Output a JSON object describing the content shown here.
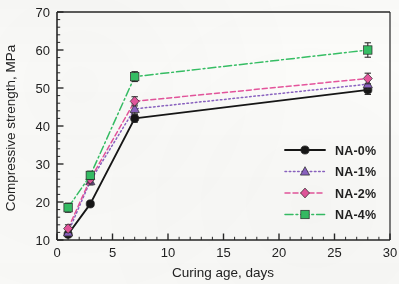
{
  "chart_data": {
    "type": "line",
    "title": "",
    "xlabel": "Curing age, days",
    "ylabel": "Compressive strength, MPa",
    "xlim": [
      0,
      30
    ],
    "ylim": [
      10,
      70
    ],
    "xticks": [
      0,
      5,
      10,
      15,
      20,
      25,
      30
    ],
    "xtick_labels": [
      "0",
      "5",
      "10",
      "15",
      "20",
      "25",
      "30"
    ],
    "yticks": [
      10,
      20,
      30,
      40,
      50,
      60,
      70
    ],
    "ytick_labels": [
      "10",
      "20",
      "30",
      "40",
      "50",
      "60",
      "70"
    ],
    "x_minor_step": 1,
    "y_minor_step": 2,
    "grid": false,
    "legend_position": "lower right",
    "x": [
      1,
      3,
      7,
      28
    ],
    "series": [
      {
        "name": "NA-0%",
        "color": "#1a1a1a",
        "linestyle": "solid",
        "marker": "circle",
        "values": [
          11.5,
          19.5,
          42.0,
          49.5
        ],
        "errors": [
          0.7,
          0.6,
          1.0,
          1.2
        ]
      },
      {
        "name": "NA-1%",
        "color": "#8c63c4",
        "linestyle": "dotted",
        "marker": "triangle",
        "values": [
          12.0,
          25.5,
          44.5,
          51.0
        ],
        "errors": [
          1.0,
          1.0,
          1.3,
          1.3
        ]
      },
      {
        "name": "NA-2%",
        "color": "#e8559e",
        "linestyle": "dashed",
        "marker": "diamond",
        "values": [
          13.0,
          26.0,
          46.5,
          52.5
        ],
        "errors": [
          1.0,
          1.0,
          1.2,
          1.4
        ]
      },
      {
        "name": "NA-4%",
        "color": "#34bf63",
        "linestyle": "dashdot",
        "marker": "square",
        "values": [
          18.5,
          27.0,
          53.0,
          60.0
        ],
        "errors": [
          1.2,
          1.1,
          1.3,
          1.9
        ]
      }
    ]
  },
  "legend": {
    "items": [
      {
        "label": "NA-0%"
      },
      {
        "label": "NA-1%"
      },
      {
        "label": "NA-2%"
      },
      {
        "label": "NA-4%"
      }
    ]
  }
}
